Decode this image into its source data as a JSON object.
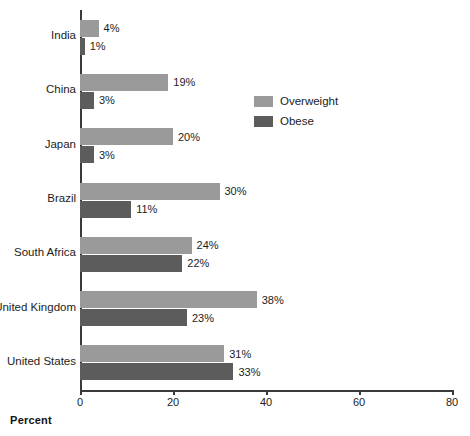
{
  "chart_data": {
    "type": "bar",
    "orientation": "horizontal",
    "title": "",
    "xlabel": "Percent",
    "ylabel": "",
    "xlim": [
      0,
      80
    ],
    "xticks": [
      0,
      20,
      40,
      60,
      80
    ],
    "xtick_labels": [
      "0",
      "20",
      "40",
      "60",
      "80"
    ],
    "grid": false,
    "legend_position": "upper-right-inside",
    "value_label_suffix": "%",
    "categories": [
      "India",
      "China",
      "Japan",
      "Brazil",
      "South Africa",
      "United Kingdom",
      "United States"
    ],
    "series": [
      {
        "name": "Overweight",
        "color": "#9a9a9a",
        "values": [
          4,
          19,
          20,
          30,
          24,
          38,
          31
        ],
        "value_labels": [
          "4%",
          "19%",
          "20%",
          "30%",
          "24%",
          "38%",
          "31%"
        ]
      },
      {
        "name": "Obese",
        "color": "#5c5c5c",
        "values": [
          1,
          3,
          3,
          11,
          22,
          23,
          33
        ],
        "value_labels": [
          "1%",
          "3%",
          "3%",
          "11%",
          "22%",
          "23%",
          "33%"
        ]
      }
    ]
  },
  "legend": {
    "items": [
      {
        "label": "Overweight",
        "color": "#9a9a9a"
      },
      {
        "label": "Obese",
        "color": "#5c5c5c"
      }
    ]
  },
  "axis": {
    "x_title": "Percent"
  }
}
